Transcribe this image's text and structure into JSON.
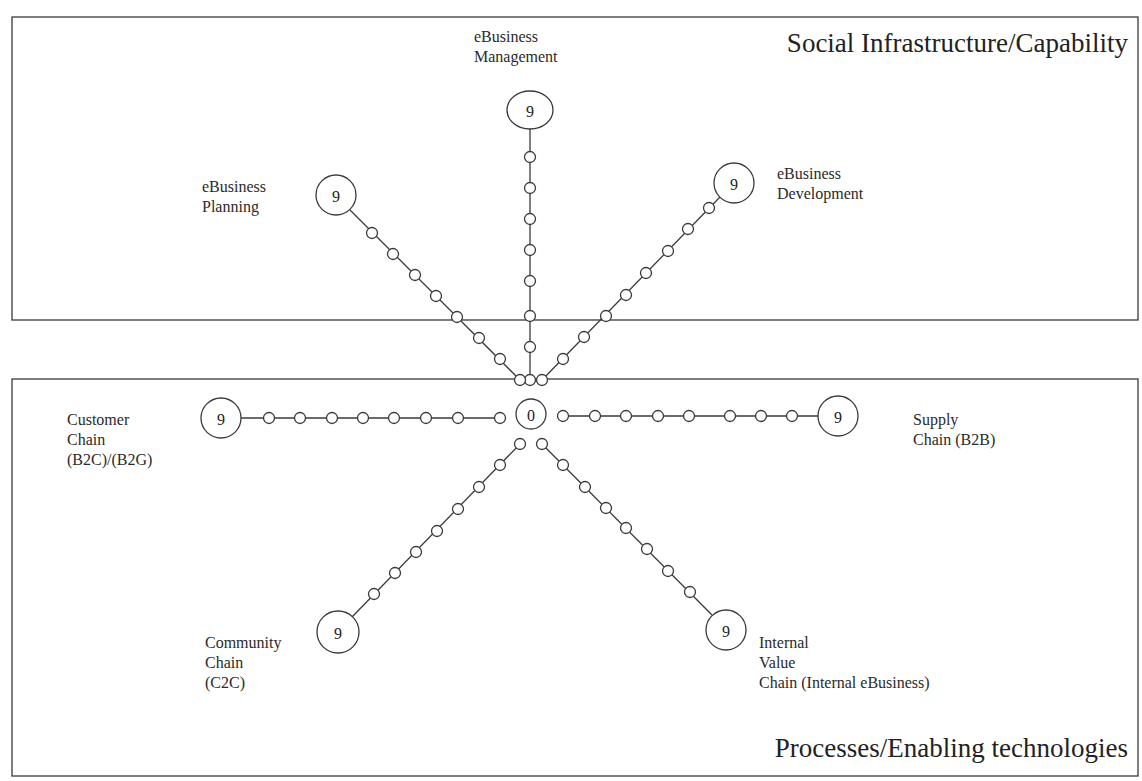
{
  "regions": {
    "top": {
      "title": "Social Infrastructure/Capability"
    },
    "bottom": {
      "title": "Processes/Enabling technologies"
    }
  },
  "center": {
    "value": "0"
  },
  "spokes": [
    {
      "id": "ebusiness-management",
      "label_lines": [
        "eBusiness",
        "Management"
      ],
      "max_value": "9"
    },
    {
      "id": "ebusiness-planning",
      "label_lines": [
        "eBusiness",
        "Planning"
      ],
      "max_value": "9"
    },
    {
      "id": "ebusiness-development",
      "label_lines": [
        "eBusiness",
        "Development"
      ],
      "max_value": "9"
    },
    {
      "id": "customer-chain",
      "label_lines": [
        "Customer",
        "Chain",
        "(B2C)/(B2G)"
      ],
      "max_value": "9"
    },
    {
      "id": "supply-chain",
      "label_lines": [
        "Supply",
        "Chain (B2B)"
      ],
      "max_value": "9"
    },
    {
      "id": "community-chain",
      "label_lines": [
        "Community",
        "Chain",
        "(C2C)"
      ],
      "max_value": "9"
    },
    {
      "id": "internal-value-chain",
      "label_lines": [
        "Internal",
        "Value",
        "Chain (Internal eBusiness)"
      ],
      "max_value": "9"
    }
  ],
  "colors": {
    "stroke": "#333333",
    "background": "#ffffff"
  }
}
